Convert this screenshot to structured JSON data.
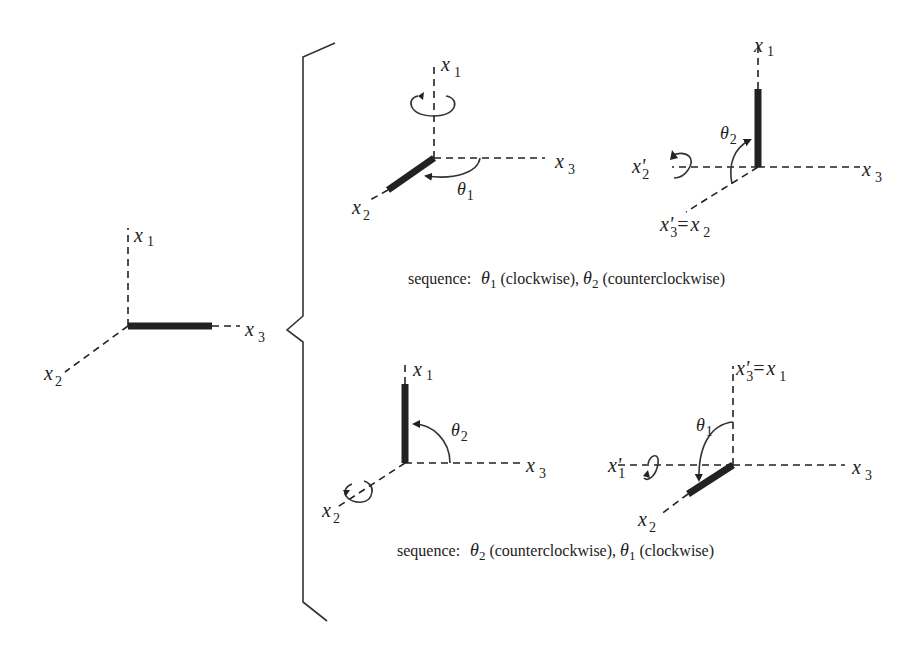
{
  "figure": {
    "axis_labels": {
      "x1": "x",
      "x1_sub": "1",
      "x2": "x",
      "x2_sub": "2",
      "x3": "x",
      "x3_sub": "3",
      "x1_prime": "x'",
      "x1_prime_sub": "1",
      "x2_prime": "x'",
      "x2_prime_sub": "2",
      "x3_prime": "x'",
      "x3_prime_sub": "3",
      "equals": "="
    },
    "angles": {
      "theta": "θ",
      "theta1_sub": "1",
      "theta2_sub": "2"
    },
    "initial": {
      "description": "Initial orientation: bar along x3"
    },
    "top_sequence": {
      "step1": {
        "rotation_axis": "x1",
        "angle": "θ1",
        "result_bar_axis": "x2"
      },
      "step2": {
        "rotation_axis": "x2'",
        "angle": "θ2",
        "result_bar_axis": "x1",
        "relabel": "x'3 = x2"
      },
      "caption_prefix": "sequence:",
      "caption_part1_paren": "(clockwise),",
      "caption_part2_paren": "(counterclockwise)"
    },
    "bottom_sequence": {
      "step1": {
        "rotation_axis": "x2",
        "angle": "θ2",
        "result_bar_axis": "x1"
      },
      "step2": {
        "rotation_axis": "x1'",
        "angle": "θ1",
        "result_bar_axis": "x2",
        "relabel": "x'3 = x1"
      },
      "caption_prefix": "sequence:",
      "caption_part1_paren": "(counterclockwise),",
      "caption_part2_paren": "(clockwise)"
    }
  }
}
